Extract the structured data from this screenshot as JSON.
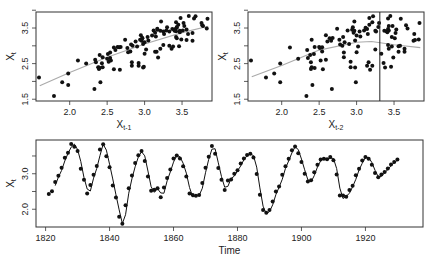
{
  "colors": {
    "axis": "#333333",
    "point": "#111111",
    "smooth": "#aaaaaa",
    "line": "#111111",
    "vline": "#222222"
  },
  "chart_data": [
    {
      "id": "lag1",
      "type": "scatter",
      "title": "",
      "xlabel": "X",
      "xlabel_sub": "t-1",
      "ylabel": "X",
      "ylabel_sub": "t",
      "xlim": [
        1.55,
        3.9
      ],
      "ylim": [
        1.45,
        3.95
      ],
      "xticks": [
        2.0,
        2.5,
        3.0,
        3.5
      ],
      "xtick_labels": [
        "2.0",
        "2.5",
        "3.0",
        "3.5"
      ],
      "yticks": [
        1.5,
        2.0,
        2.5,
        3.0,
        3.5,
        4.0
      ],
      "ytick_labels": [
        "1.5",
        "",
        "2.5",
        "",
        "3.5",
        ""
      ],
      "smoother": "lowess",
      "smooth_line": [
        [
          1.6,
          1.88
        ],
        [
          2.0,
          2.25
        ],
        [
          2.5,
          2.68
        ],
        [
          3.0,
          3.05
        ],
        [
          3.5,
          3.37
        ],
        [
          3.85,
          3.55
        ]
      ]
    },
    {
      "id": "lag2",
      "type": "scatter",
      "title": "",
      "xlabel": "X",
      "xlabel_sub": "t-2",
      "ylabel": "X",
      "ylabel_sub": "t",
      "xlim": [
        1.55,
        3.9
      ],
      "ylim": [
        1.45,
        3.95
      ],
      "xticks": [
        2.0,
        2.5,
        3.0,
        3.5
      ],
      "xtick_labels": [
        "2.0",
        "2.5",
        "3.0",
        "3.5"
      ],
      "yticks": [
        1.5,
        2.0,
        2.5,
        3.0,
        3.5,
        4.0
      ],
      "ytick_labels": [
        "1.5",
        "",
        "2.5",
        "",
        "3.5",
        ""
      ],
      "smoother": "lowess",
      "smooth_line": [
        [
          1.6,
          2.13
        ],
        [
          2.0,
          2.45
        ],
        [
          2.5,
          2.88
        ],
        [
          3.0,
          3.1
        ],
        [
          3.2,
          3.12
        ],
        [
          3.5,
          3.03
        ],
        [
          3.85,
          2.95
        ]
      ],
      "threshold_vline": 3.31
    },
    {
      "id": "series",
      "type": "line",
      "title": "",
      "xlabel": "Time",
      "ylabel": "X",
      "ylabel_sub": "t",
      "xlim": [
        1817,
        1938
      ],
      "ylim": [
        1.5,
        3.95
      ],
      "xticks": [
        1820,
        1840,
        1860,
        1880,
        1900,
        1920
      ],
      "xtick_labels": [
        "1820",
        "1840",
        "1860",
        "1880",
        "1900",
        "1920"
      ],
      "yticks": [
        2.0,
        2.5,
        3.0,
        3.5
      ],
      "ytick_labels": [
        "2.0",
        "",
        "3.0",
        ""
      ],
      "start_year": 1821,
      "observed": [
        2.43,
        2.51,
        2.77,
        2.94,
        3.17,
        3.45,
        3.59,
        3.84,
        3.76,
        3.64,
        3.14,
        2.83,
        2.44,
        2.68,
        2.97,
        3.22,
        3.68,
        3.83,
        3.49,
        3.18,
        2.67,
        2.33,
        1.79,
        1.59,
        2.11,
        2.59,
        2.95,
        3.3,
        3.52,
        3.64,
        3.36,
        2.92,
        2.52,
        2.55,
        2.59,
        2.34,
        2.61,
        2.88,
        3.12,
        3.43,
        3.51,
        3.43,
        3.21,
        2.92,
        2.44,
        2.4,
        2.38,
        2.4,
        2.74,
        3.17,
        3.48,
        3.78,
        3.56,
        3.16,
        2.83,
        2.54,
        2.81,
        2.84,
        3.0,
        3.1,
        3.29,
        3.43,
        3.53,
        3.56,
        3.46,
        2.99,
        2.41,
        1.98,
        1.9,
        1.98,
        2.22,
        2.5,
        2.64,
        2.97,
        3.21,
        3.42,
        3.66,
        3.77,
        3.58,
        3.33,
        3.0,
        2.78,
        2.82,
        3.04,
        3.25,
        3.4,
        3.42,
        3.41,
        3.47,
        3.38,
        2.98,
        2.39,
        2.39,
        2.35,
        2.54,
        2.66,
        2.96,
        3.14,
        3.37,
        3.47,
        3.42,
        3.25,
        3.02,
        2.9,
        2.98,
        3.05,
        3.15,
        3.26,
        3.33,
        3.4
      ]
    }
  ]
}
